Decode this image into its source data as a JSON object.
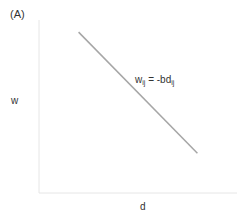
{
  "chart_data": {
    "type": "line",
    "title": "(A)",
    "xlabel": "d",
    "ylabel": "w",
    "annotation": {
      "base": "w",
      "sub1": "ij",
      "eq": " = -bd",
      "sub2": "ij"
    },
    "x": [
      0.2,
      0.8
    ],
    "series": [
      {
        "name": "w_ij = -bd_ij",
        "values": [
          0.93,
          0.23
        ]
      }
    ],
    "xlim": [
      0,
      1
    ],
    "ylim": [
      0,
      1
    ],
    "grid": false,
    "colors": {
      "axis": "#e6e6e6",
      "line": "#a6a6a6"
    }
  }
}
